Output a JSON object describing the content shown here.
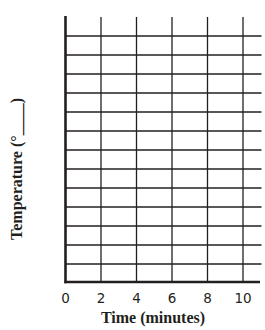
{
  "chart_data": {
    "type": "line",
    "title": "",
    "xlabel": "Time (minutes)",
    "ylabel": "Temperature (°____)",
    "x_ticks": [
      "0",
      "2",
      "4",
      "6",
      "8",
      "10"
    ],
    "x_tick_values": [
      0,
      2,
      4,
      6,
      8,
      10
    ],
    "xlim": [
      0,
      11
    ],
    "y_ticks": [],
    "y_gridlines_count": 13,
    "grid": true,
    "legend": null,
    "series": [],
    "note": "Blank graph grid with no plotted data; y-axis units left blank for student to fill in"
  },
  "colors": {
    "grid": "#231f20",
    "axis": "#231f20",
    "background": "#ffffff"
  },
  "layout": {
    "origin_x": 65.5,
    "origin_y": 282,
    "axis_top_y": 16,
    "right_x": 261.5,
    "x_tick_px": [
      65.5,
      101,
      136.5,
      172,
      207.5,
      243
    ],
    "h_grid_px": [
      36,
      55,
      74,
      93,
      112,
      131,
      150,
      169,
      188,
      207,
      226,
      245,
      264
    ]
  }
}
